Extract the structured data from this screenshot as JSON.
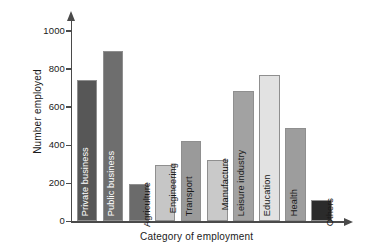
{
  "chart_data": {
    "type": "bar",
    "title": "",
    "xlabel": "Category of employment",
    "ylabel": "Number employed",
    "categories": [
      "Private business",
      "Public business",
      "Agriculture",
      "Engineering",
      "Transport",
      "Manufacture",
      "Leisure industry",
      "Education",
      "Health",
      "Others"
    ],
    "values": [
      745,
      895,
      195,
      295,
      420,
      320,
      685,
      770,
      490,
      110
    ],
    "ylim": [
      0,
      1050
    ],
    "yticks": [
      0,
      200,
      400,
      600,
      800,
      1000
    ],
    "ytick_labels": [
      "0",
      "200",
      "400",
      "600",
      "800",
      "1000"
    ],
    "grid": false,
    "legend": false,
    "bar_colors": [
      "#575757",
      "#6e6e6e",
      "#6b6b6b",
      "#c6c6c6",
      "#d6d6d6",
      "#9a9a9a",
      "#c9c9c9",
      "#a2a2a2",
      "#bdbdbd",
      "#eeeeee",
      "#2b2b2b"
    ],
    "bars": [
      {
        "label": "Private business",
        "value": 745,
        "color": "#575757",
        "label_color": "dark-text",
        "label_outside": false
      },
      {
        "label": "Public business",
        "value": 895,
        "color": "#6e6e6e",
        "label_color": "dark-text",
        "label_outside": false
      },
      {
        "label": "Agriculture",
        "value": 195,
        "color": "#6b6b6b",
        "label_color": "light-text",
        "label_outside": true
      },
      {
        "label": "Engineering",
        "value": 295,
        "color": "#c6c6c6",
        "label_color": "light-text",
        "label_outside": true
      },
      {
        "label": "Transport",
        "value": 420,
        "color": "#9a9a9a",
        "label_color": "light-text",
        "label_outside": false
      },
      {
        "label": "Manufacture",
        "value": 320,
        "color": "#c9c9c9",
        "label_color": "light-text",
        "label_outside": true
      },
      {
        "label": "Leisure industry",
        "value": 685,
        "color": "#a2a2a2",
        "label_color": "light-text",
        "label_outside": false
      },
      {
        "label": "Education",
        "value": 770,
        "color": "#e2e2e2",
        "label_color": "light-text",
        "label_outside": false
      },
      {
        "label": "Health",
        "value": 490,
        "color": "#9d9d9d",
        "label_color": "light-text",
        "label_outside": false
      },
      {
        "label": "Others",
        "value": 110,
        "color": "#2b2b2b",
        "label_color": "light-text",
        "label_outside": true
      }
    ]
  },
  "axes": {
    "y_title": "Number employed",
    "x_title": "Category of employment"
  }
}
